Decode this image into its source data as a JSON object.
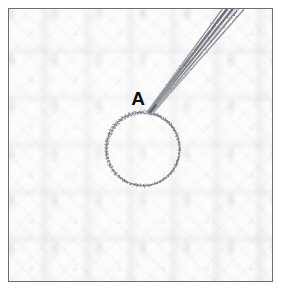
{
  "figure": {
    "caption": "",
    "frame": {
      "border_color": "#6e6e72",
      "background_color": "#fcfcfb",
      "inset_px": 8,
      "width_px": 265,
      "height_px": 274
    },
    "surface": {
      "description": "pale textured knitted fabric",
      "base_color": "#fbfbfa",
      "texture_color": "#a8aab4"
    },
    "annotations": [
      {
        "id": "A",
        "label": "A",
        "label_color": "#0d0d0d",
        "type": "circle-marker",
        "shape": "circle",
        "stroke_color": "#7a7c86",
        "stroke_style": "hand-drawn-stippled",
        "center_x": 143,
        "center_y": 149,
        "radius": 37,
        "label_x": 129,
        "label_y": 88
      },
      {
        "id": "leader",
        "label": "",
        "type": "leader-stroke",
        "shape": "tapered-stroke-bundle",
        "stroke_color": "#6b6d77",
        "stroke_style": "pencil",
        "start_x": 228,
        "start_y": 6,
        "end_x": 149,
        "end_y": 110,
        "strand_count": 5
      }
    ]
  }
}
